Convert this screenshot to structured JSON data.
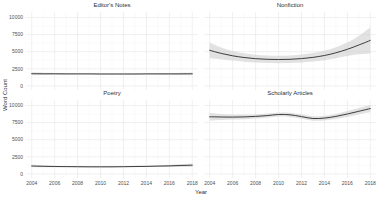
{
  "colors": {
    "background": "#ffffff",
    "line": "#3d3d3d",
    "ribbon": "#cfcfcf",
    "grid_major": "#e9e9e9",
    "grid_minor": "#f4f4f4",
    "title_text": "#303030",
    "tick_text": "#4f4f4f"
  },
  "chart_data": {
    "type": "line",
    "title": "",
    "xlabel": "Year",
    "ylabel": "Word Count",
    "legend": "none",
    "grid": "major+minor",
    "band": "confidence ribbon around smoothed line",
    "ylim": [
      0,
      10000
    ],
    "y_ticks": [
      0,
      2500,
      5000,
      7500,
      10000
    ],
    "x_ticks": [
      2004,
      2006,
      2008,
      2010,
      2012,
      2014,
      2016,
      2018
    ],
    "x": [
      2004,
      2005,
      2006,
      2007,
      2008,
      2009,
      2010,
      2011,
      2012,
      2013,
      2014,
      2015,
      2016,
      2017,
      2018
    ],
    "facets": [
      {
        "title": "Editor's Notes",
        "values": [
          1780,
          1770,
          1762,
          1755,
          1750,
          1746,
          1744,
          1743,
          1743,
          1744,
          1746,
          1750,
          1754,
          1760,
          1766
        ],
        "ci": [
          210,
          165,
          135,
          115,
          105,
          100,
          97,
          95,
          95,
          97,
          100,
          108,
          125,
          155,
          200
        ]
      },
      {
        "title": "Nonfiction",
        "values": [
          5200,
          4750,
          4400,
          4150,
          3980,
          3890,
          3860,
          3890,
          3990,
          4170,
          4440,
          4840,
          5350,
          5970,
          6650
        ],
        "ci": [
          1150,
          860,
          700,
          620,
          580,
          560,
          550,
          560,
          580,
          620,
          690,
          800,
          980,
          1350,
          1900
        ]
      },
      {
        "title": "Poetry",
        "values": [
          1150,
          1115,
          1085,
          1063,
          1048,
          1040,
          1038,
          1042,
          1055,
          1075,
          1100,
          1135,
          1175,
          1222,
          1272
        ],
        "ci": [
          185,
          145,
          118,
          102,
          93,
          88,
          86,
          88,
          93,
          102,
          114,
          134,
          162,
          205,
          258
        ]
      },
      {
        "title": "Scholarly Articles",
        "values": [
          8350,
          8320,
          8305,
          8330,
          8400,
          8520,
          8680,
          8640,
          8380,
          8100,
          8160,
          8400,
          8760,
          9150,
          9550
        ],
        "ci": [
          560,
          440,
          375,
          340,
          320,
          308,
          300,
          308,
          325,
          330,
          340,
          375,
          425,
          475,
          520
        ]
      }
    ]
  }
}
